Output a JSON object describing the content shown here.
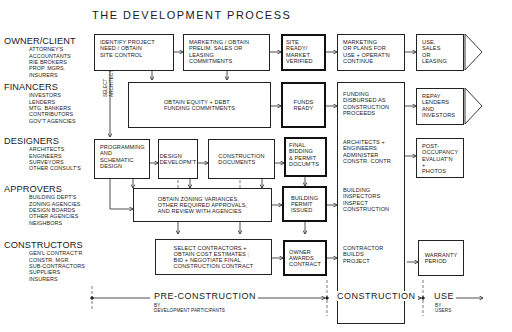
{
  "title": "THE DEVELOPMENT PROCESS",
  "roles": [
    {
      "name": "OWNER/CLIENT",
      "members": [
        "ATTORNEY'S",
        "ACCOUNTANTS",
        "R/E BROKERS",
        "PROP. MGRS.",
        "INSURERS"
      ]
    },
    {
      "name": "FINANCERS",
      "members": [
        "INVESTORS",
        "LENDERS",
        "MTG. BANKERS",
        "CONTRIBUTORS",
        "GOV'T AGENCIES"
      ]
    },
    {
      "name": "DESIGNERS",
      "members": [
        "ARCHITECTS",
        "ENGINEERS",
        "SURVEYORS",
        "OTHER CONSULT'S"
      ]
    },
    {
      "name": "APPROVERS",
      "members": [
        "BUILDING DEPT'S",
        "ZONING AGENCIES",
        "DESIGN BOARDS",
        "OTHER AGENCIES",
        "NEIGHBORS"
      ]
    },
    {
      "name": "CONSTRUCTORS",
      "members": [
        "GEN'L CONTRACT'R",
        "CONSTR. MGR.",
        "SUB-CONTRACTORS",
        "SUPPLIERS",
        "INSURERS"
      ]
    }
  ],
  "select_architect": "SELECT\nARCHITECT",
  "boxes": {
    "identify": "IDENTIFY PROJECT\nNEED / OBTAIN\nSITE CONTROL",
    "marketing": "MARKETING / OBTAIN\nPRELIM. SALES OR\nLEASING\nCOMMITMENTS",
    "site_ready": "SITE\nREADY/\nMARKET\nVERIFIED",
    "marketing_plans": "MARKETING\nOR PLANS FOR\nUSE + OPERAT'N\nCONTINUE",
    "use_sales": "USE,\nSALES\nOR\nLEASING",
    "equity": "OBTAIN EQUITY + DEBT\nFUNDING COMMITMENTS",
    "funds_ready": "FUNDS\nREADY",
    "funding_disbursed": "FUNDING\nDISBURSED AS\nCONSTRUCTION\nPROCEEDS",
    "repay": "REPAY\nLENDERS\nAND\nINVESTORS",
    "programming": "PROGRAMMING\nAND\nSCHEMATIC\nDESIGN",
    "design_dev": "DESIGN\nDEVELOPM'T",
    "construction_docs": "CONSTRUCTION\nDOCUMENTS",
    "final_bidding": "FINAL\nBIDDING\n& PERMIT\nDOCUM'TS",
    "architects_administer": "ARCHITECTS +\nENGINEERS\nADMINISTER\nCONSTR. CONTR.",
    "post_occupancy": "POST-\nOCCUPANCY\nEVALUAT'N\n+\nPHOTOS",
    "zoning": "OBTAIN ZONING VARIANCES,\nOTHER REQUIRED APPROVALS,\nAND REVIEW WITH AGENCIES",
    "permit_issued": "BUILDING\nPERMIT\nISSUED",
    "inspectors": "BUILDING\nINSPECTORS\nINSPECT\nCONSTRUCTION",
    "select_contractors": "SELECT CONTRACTORS +\nOBTAIN COST ESTIMATES ;\nBID + NEGOTIATE FINAL\nCONSTRUCTION CONTRACT",
    "owner_awards": "OWNER\nAWARDS\nCONTRACT",
    "contractor_builds": "CONTRACTOR\nBUILDS\nPROJECT",
    "warranty": "WARRANTY\nPERIOD"
  },
  "phases": [
    {
      "name": "PRE-CONSTRUCTION",
      "sub": "BY\nDEVELOPMENT PARTICIPANTS"
    },
    {
      "name": "CONSTRUCTION",
      "sub": ""
    },
    {
      "name": "USE",
      "sub": "BY\nUSERS"
    }
  ]
}
